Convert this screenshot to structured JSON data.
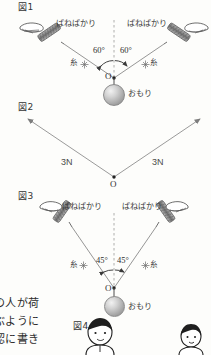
{
  "page": {
    "background_color": "#fdfdfb",
    "ink_color": "#2b2b2b",
    "line_color": "#8a8a8a"
  },
  "figures": [
    {
      "id": "fig1",
      "tag": "図1",
      "spring_scale_left_label": "ばねばかり",
      "spring_scale_right_label": "ばねばかり",
      "thread_left_label": "糸",
      "thread_right_label": "糸",
      "angle_left": "60°",
      "angle_right": "60°",
      "origin_label": "O",
      "weight_label": "おもり"
    },
    {
      "id": "fig2",
      "tag": "図2",
      "force_left_label": "3N",
      "force_right_label": "3N",
      "origin_label": "O"
    },
    {
      "id": "fig3",
      "tag": "図3",
      "spring_scale_left_label": "ばねばかり",
      "spring_scale_right_label": "ばねばかり",
      "thread_left_label": "糸",
      "thread_right_label": "糸",
      "angle_left": "45°",
      "angle_right": "45°",
      "origin_label": "O",
      "weight_label": "おもり"
    },
    {
      "id": "fig4",
      "tag": "図4"
    }
  ],
  "body_text": {
    "line1": "の人が荷",
    "line2": "ぶように",
    "line3": "認に書き"
  }
}
